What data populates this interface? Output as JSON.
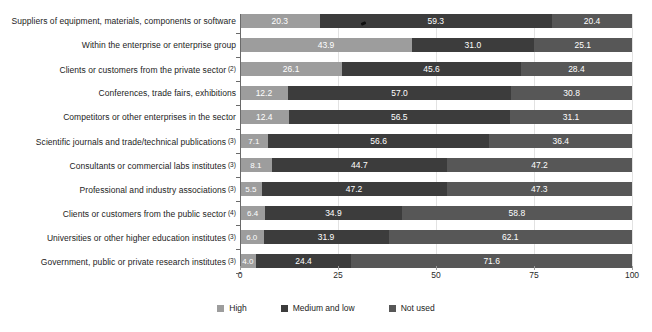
{
  "chart_data": {
    "type": "bar",
    "orientation": "horizontal",
    "stacked": true,
    "title": "",
    "subtitle": "",
    "xlabel": "",
    "ylabel": "",
    "xlim": [
      0,
      100
    ],
    "xticks": [
      "0",
      "25",
      "50",
      "75",
      "100"
    ],
    "grid": true,
    "legend_position": "bottom",
    "categories": [
      "Suppliers of equipment, materials, components or software",
      "Within the enterprise or enterprise group",
      "Clients or customers from the private sector",
      "Conferences, trade fairs, exhibitions",
      "Competitors or other enterprises in the sector",
      "Scientific journals and trade/technical publications",
      "Consultants or commercial labs institutes",
      "Professional and industry associations",
      "Clients or customers from the public sector",
      "Universities or other higher education institutes",
      "Government, public or private research institutes"
    ],
    "category_footnotes": [
      "",
      "",
      "(2)",
      "",
      "",
      "(3)",
      "(3)",
      "(3)",
      "(4)",
      "(3)",
      "(3)"
    ],
    "series": [
      {
        "name": "High",
        "color": "#9d9d9d",
        "values": [
          20.3,
          43.9,
          26.1,
          12.2,
          12.4,
          7.1,
          8.1,
          5.5,
          6.4,
          6.0,
          4.0
        ]
      },
      {
        "name": "Medium and low",
        "color": "#3c3c3c",
        "values": [
          59.3,
          31.0,
          45.6,
          57.0,
          56.5,
          56.6,
          44.7,
          47.2,
          34.9,
          31.9,
          24.4
        ]
      },
      {
        "name": "Not used",
        "color": "#575757",
        "values": [
          20.4,
          25.1,
          28.4,
          30.8,
          31.1,
          36.4,
          47.2,
          47.3,
          58.8,
          62.1,
          71.6
        ]
      }
    ]
  },
  "legend": {
    "items": [
      {
        "label": "High",
        "color": "#9d9d9d"
      },
      {
        "label": "Medium and low",
        "color": "#3c3c3c"
      },
      {
        "label": "Not used",
        "color": "#575757"
      }
    ]
  }
}
